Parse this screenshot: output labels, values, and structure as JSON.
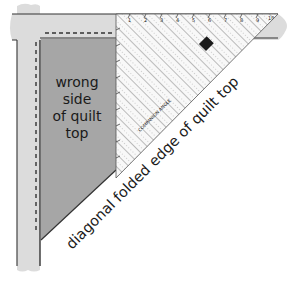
{
  "diagram": {
    "labels": {
      "wrong_side_lines": [
        "wrong",
        "side",
        "of quilt",
        "top"
      ],
      "diagonal_edge": "diagonal folded edge of quilt top"
    },
    "ruler": {
      "brand_logo": "EZ",
      "product_text": "COMPANION ANGLE",
      "tick_numbers": [
        "1",
        "2",
        "3",
        "4",
        "5",
        "6",
        "7",
        "8",
        "9",
        "10"
      ]
    },
    "colors": {
      "background": "#ffffff",
      "border_strip": "#dcdcdc",
      "quilt_wrong_side": "#a6a6a6",
      "outline": "#333333",
      "ruler_fill": "#f7f7f7",
      "ruler_lines": "#7a7a7a",
      "logo_bg": "#1a1a1a",
      "logo_fg": "#ffffff"
    }
  }
}
